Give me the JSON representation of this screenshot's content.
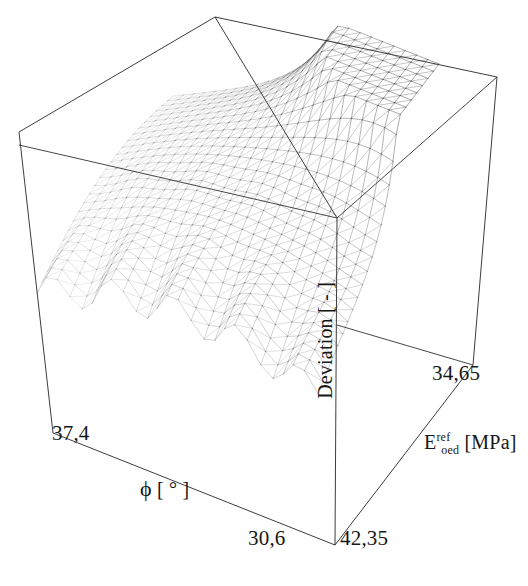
{
  "figure": {
    "kind": "3d-surface-wireframe",
    "background": "#ffffff",
    "line_color": "#404040",
    "box_color": "#333333"
  },
  "axes": {
    "x": {
      "name": "phi",
      "title_prefix": "ϕ",
      "title_unit": "[ ° ]",
      "min_label": "30,6",
      "max_label": "37,4"
    },
    "y": {
      "name": "E_oed_ref",
      "title_symbol": "E",
      "title_sup": "ref",
      "title_sub": "oed",
      "title_unit": "[MPa]",
      "min_label": "42,35",
      "max_label": "34,65"
    },
    "z": {
      "name": "deviation",
      "title": "Deviation [ - ]"
    }
  },
  "chart_data": {
    "type": "surface",
    "title": "",
    "xlabel": "ϕ [ ° ]",
    "ylabel": "E_oed^ref [MPa]",
    "zlabel": "Deviation [ - ]",
    "xlim": [
      30.6,
      37.4
    ],
    "ylim": [
      34.65,
      42.35
    ],
    "grid": true,
    "legend": "none",
    "x_tick_labels": [
      "30,6",
      "37,4"
    ],
    "y_tick_labels": [
      "34,65",
      "42,35"
    ],
    "nx": 26,
    "ny": 26,
    "surface_model": {
      "ridge_corner": [
        1.0,
        1.0
      ],
      "ridge_height": 1.0,
      "plateau_height": 0.38,
      "ripple_amplitude": 0.055,
      "ripple_frequency": 9.0
    }
  },
  "geometry": {
    "corners": {
      "back_top": [
        215,
        17
      ],
      "left_top": [
        19,
        132
      ],
      "right_top": [
        497,
        77
      ],
      "front_top": [
        337,
        218
      ],
      "left_bottom": [
        53,
        433
      ],
      "right_bottom": [
        473,
        365
      ],
      "front_bottom": [
        335,
        545
      ]
    }
  }
}
